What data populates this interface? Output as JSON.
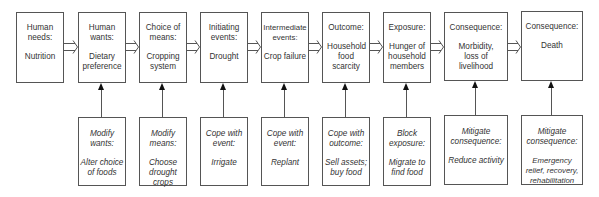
{
  "diagram": {
    "type": "causal-chain",
    "top_row": [
      {
        "id": "needs",
        "head": "Human needs:",
        "body": "Nutrition"
      },
      {
        "id": "wants",
        "head": "Human wants:",
        "body": "Dietary preference"
      },
      {
        "id": "means",
        "head": "Choice of means:",
        "body": "Cropping system"
      },
      {
        "id": "initiating",
        "head": "Initiating events:",
        "body": "Drought"
      },
      {
        "id": "intermediate",
        "head": "Intermediate events:",
        "body": "Crop failure"
      },
      {
        "id": "outcome",
        "head": "Outcome:",
        "body": "Household food scarcity"
      },
      {
        "id": "exposure",
        "head": "Exposure:",
        "body": "Hunger of household members"
      },
      {
        "id": "consequence1",
        "head": "Consequence:",
        "body": "Morbidity, loss of livelihood"
      },
      {
        "id": "consequence2",
        "head": "Consequence:",
        "body": "Death"
      }
    ],
    "bottom_row": [
      {
        "targets": "wants",
        "head": "Modify wants:",
        "body": "Alter choice of foods"
      },
      {
        "targets": "means",
        "head": "Modify means:",
        "body": "Choose drought crops"
      },
      {
        "targets": "initiating",
        "head": "Cope with event:",
        "body": "Irrigate"
      },
      {
        "targets": "intermediate",
        "head": "Cope with event:",
        "body": "Replant"
      },
      {
        "targets": "outcome",
        "head": "Cope with outcome:",
        "body": "Sell assets; buy food"
      },
      {
        "targets": "exposure",
        "head": "Block exposure:",
        "body": "Migrate to find food"
      },
      {
        "targets": "consequence1",
        "head": "Mitigate consequence:",
        "body": "Reduce activity"
      },
      {
        "targets": "consequence2",
        "head": "Mitigate consequence:",
        "body": "Emergency relief, recovery, rehabilitation"
      }
    ],
    "colors": {
      "line": "#555555",
      "arrowhead": "#111111",
      "text": "#333333"
    }
  }
}
